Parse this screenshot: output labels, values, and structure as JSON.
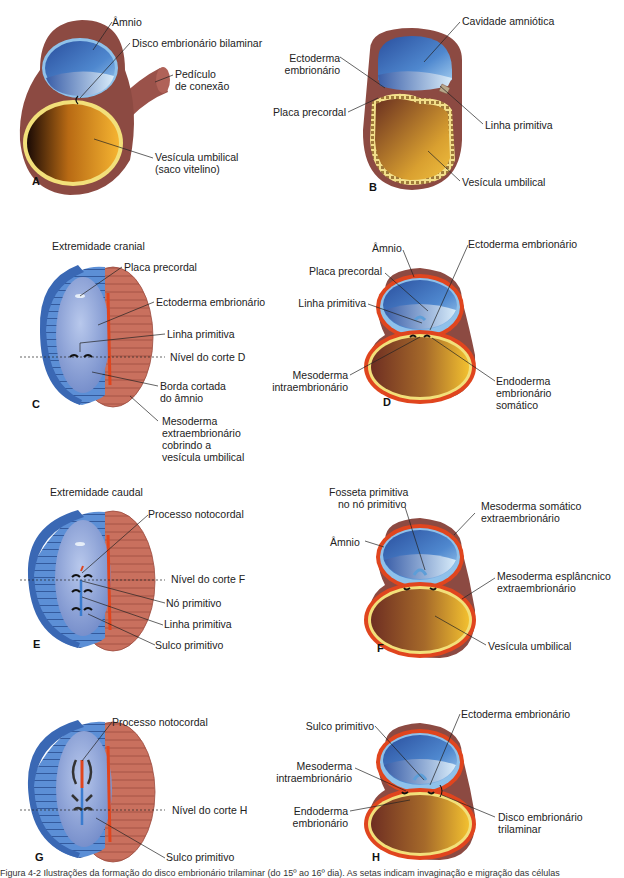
{
  "figure": {
    "caption": "Figura 4-2 Ilustrações da formação do disco embrionário trilaminar (do 15º ao 16º dia). As setas indicam invaginação e migração das células",
    "colors": {
      "amnion_blue": "#3d6fb6",
      "amnion_light": "#9cc3e8",
      "mesoderm_brown": "#8c4a42",
      "mesoderm_red": "#e0451e",
      "yolk_gold": "#e8a82a",
      "yolk_dark": "#5a2a10",
      "endoderm_yellow": "#f4e08a",
      "disc_salmon": "#c9705e"
    },
    "panels": [
      {
        "id": "A",
        "labels": [
          "Âmnio",
          "Disco embrionário bilaminar",
          "Pedículo de conexão",
          "Vesícula umbilical (saco vitelino)"
        ]
      },
      {
        "id": "B",
        "labels": [
          "Cavidade amniótica",
          "Ectoderma embrionário",
          "Placa precordal",
          "Linha primitiva",
          "Vesícula umbilical"
        ]
      },
      {
        "id": "C",
        "heading": "Extremidade cranial",
        "labels": [
          "Placa precordal",
          "Ectoderma embrionário",
          "Linha primitiva",
          "Nível do corte D",
          "Borda cortada do âmnio",
          "Mesoderma extraembrionário cobrindo a vesícula umbilical"
        ]
      },
      {
        "id": "D",
        "labels": [
          "Âmnio",
          "Ectoderma embrionário",
          "Placa precordal",
          "Linha primitiva",
          "Mesoderma intraembrionário",
          "Endoderma embrionário somático"
        ]
      },
      {
        "id": "E",
        "heading": "Extremidade caudal",
        "labels": [
          "Processo notocordal",
          "Nível do corte F",
          "Nó primitivo",
          "Linha primitiva",
          "Sulco primitivo"
        ]
      },
      {
        "id": "F",
        "labels": [
          "Fosseta primitiva no nó primitivo",
          "Mesoderma somático extraembrionário",
          "Âmnio",
          "Mesoderma esplâncnico extraembrionário",
          "Vesícula umbilical"
        ]
      },
      {
        "id": "G",
        "labels": [
          "Processo notocordal",
          "Nível do corte H",
          "Sulco primitivo"
        ]
      },
      {
        "id": "H",
        "labels": [
          "Sulco primitivo",
          "Ectoderma embrionário",
          "Mesoderma intraembrionário",
          "Endoderma embrionário",
          "Disco embrionário trilaminar"
        ]
      }
    ]
  },
  "A": {
    "letter": "A",
    "amnio": "Âmnio",
    "disco": "Disco embrionário bilaminar",
    "pediculo1": "Pedículo",
    "pediculo2": "de conexão",
    "vesicula1": "Vesícula umbilical",
    "vesicula2": "(saco vitelino)"
  },
  "B": {
    "letter": "B",
    "cavidade": "Cavidade amniótica",
    "ecto1": "Ectoderma",
    "ecto2": "embrionário",
    "placa": "Placa precordal",
    "linha": "Linha primitiva",
    "vesicula": "Vesícula umbilical"
  },
  "C": {
    "letter": "C",
    "heading": "Extremidade cranial",
    "placa": "Placa precordal",
    "ecto": "Ectoderma embrionário",
    "linha": "Linha primitiva",
    "nivel": "Nível do corte D",
    "borda1": "Borda cortada",
    "borda2": "do âmnio",
    "meso1": "Mesoderma",
    "meso2": "extraembrionário",
    "meso3": "cobrindo a",
    "meso4": "vesícula umbilical"
  },
  "D": {
    "letter": "D",
    "amnio": "Âmnio",
    "ecto": "Ectoderma embrionário",
    "placa": "Placa precordal",
    "linha": "Linha primitiva",
    "meso1": "Mesoderma",
    "meso2": "intraembrionário",
    "endo1": "Endoderma",
    "endo2": "embrionário",
    "endo3": "somático"
  },
  "E": {
    "letter": "E",
    "heading": "Extremidade caudal",
    "processo": "Processo notocordal",
    "nivel": "Nível do corte F",
    "no": "Nó primitivo",
    "linha": "Linha primitiva",
    "sulco": "Sulco primitivo"
  },
  "F": {
    "letter": "F",
    "fosseta1": "Fosseta primitiva",
    "fosseta2": "no nó primitivo",
    "somatico1": "Mesoderma somático",
    "somatico2": "extraembrionário",
    "amnio": "Âmnio",
    "esplan1": "Mesoderma esplâncnico",
    "esplan2": "extraembrionário",
    "vesicula": "Vesícula umbilical"
  },
  "G": {
    "letter": "G",
    "processo": "Processo notocordal",
    "nivel": "Nível do corte H",
    "sulco": "Sulco primitivo"
  },
  "H": {
    "letter": "H",
    "sulco": "Sulco primitivo",
    "ecto": "Ectoderma embrionário",
    "meso1": "Mesoderma",
    "meso2": "intraembrionário",
    "endo1": "Endoderma",
    "endo2": "embrionário",
    "disco1": "Disco embrionário",
    "disco2": "trilaminar"
  }
}
